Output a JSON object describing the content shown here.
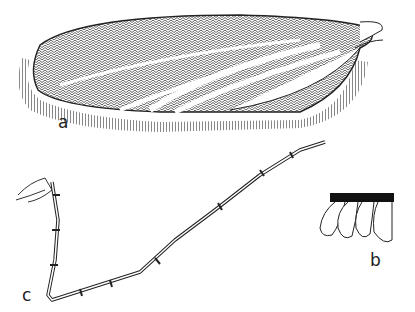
{
  "figure": {
    "panels": [
      {
        "id": "a",
        "label": "a",
        "subject": "wing"
      },
      {
        "id": "b",
        "label": "b",
        "subject": "scales"
      },
      {
        "id": "c",
        "label": "c",
        "subject": "antenna"
      }
    ],
    "colors": {
      "ink": "#222222",
      "background": "#ffffff"
    }
  }
}
